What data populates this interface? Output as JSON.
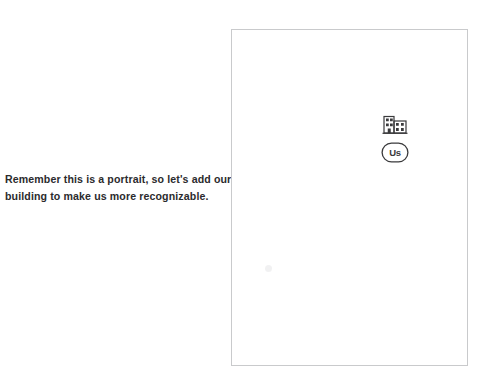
{
  "canvas": {
    "width": 490,
    "height": 392,
    "background_color": "#ffffff"
  },
  "caption": {
    "line1": "Remember this is a portrait, so let's add our",
    "line2": "building to make us more recognizable.",
    "text_color": "#2b2b2d"
  },
  "portrait": {
    "frame_label": "portrait-page",
    "border_color": "#c9cacc",
    "fill_color": "#ffffff",
    "logo": {
      "building_icon_name": "building-icon",
      "badge_text": "Us",
      "stroke_color": "#3a3a3c"
    }
  }
}
